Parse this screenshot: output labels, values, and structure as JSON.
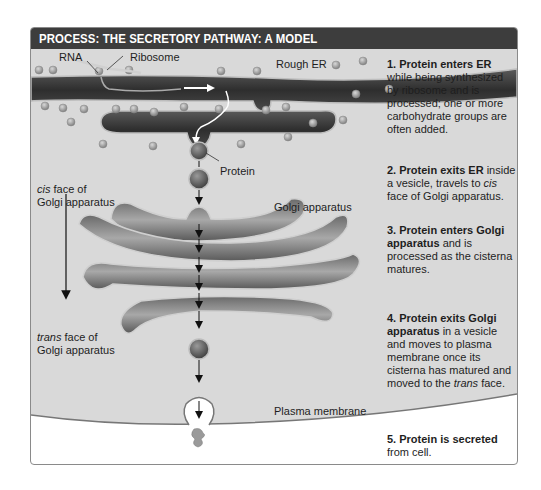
{
  "header": {
    "title": "PROCESS: THE SECRETORY PATHWAY: A MODEL"
  },
  "labels": {
    "rna": "RNA",
    "ribosome": "Ribosome",
    "rough_er": "Rough ER",
    "protein": "Protein",
    "golgi": "Golgi apparatus",
    "cis_face_italic": "cis",
    "cis_face_rest": " face of",
    "cis_face_line2": "Golgi apparatus",
    "trans_face_italic": "trans",
    "trans_face_rest": " face of",
    "trans_face_line2": "Golgi apparatus",
    "plasma_membrane": "Plasma membrane"
  },
  "steps": [
    {
      "number": "1.",
      "bold": "Protein enters ER",
      "text": " while being synthesized by ribosome and is processed; one or more carbohydrate groups are often added."
    },
    {
      "number": "2.",
      "bold": "Protein exits ER",
      "text_before_italic": " inside a vesicle, travels to ",
      "italic": "cis",
      "text_after_italic": " face of Golgi apparatus."
    },
    {
      "number": "3.",
      "bold": "Protein enters Golgi apparatus",
      "text": " and is processed as the cisterna matures."
    },
    {
      "number": "4.",
      "bold": "Protein exits Golgi apparatus",
      "text_before_italic": " in a vesicle and moves to plasma membrane once its cisterna has matured and moved to the ",
      "italic": "trans",
      "text_after_italic": " face."
    },
    {
      "number": "5.",
      "bold": "Protein is secreted",
      "text": " from cell."
    }
  ],
  "colors": {
    "header_bg": "#3d3d3d",
    "cytoplasm": "#d9d9d9",
    "organelle_dark": "#3a3a3a",
    "organelle_mid": "#7a7a7a",
    "membrane": "#bdbdbd",
    "extracellular": "#ffffff"
  }
}
